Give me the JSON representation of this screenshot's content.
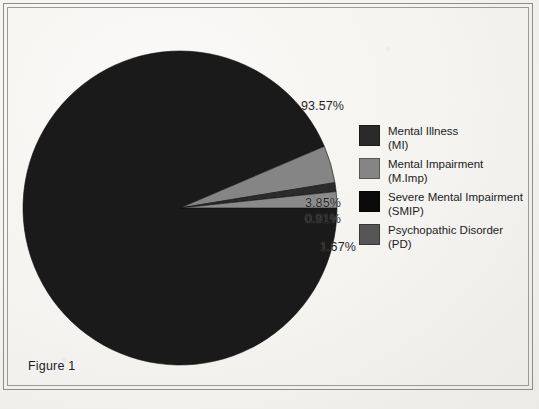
{
  "figure": {
    "caption": "Figure 1"
  },
  "colors": {
    "page_background": "#f4f3f0",
    "frame_line": "#8d8d8d",
    "text": "#1c1c1c",
    "slice_mi": "#1a1a1a",
    "slice_mimp": "#858585",
    "slice_smip": "#2b2b2b",
    "slice_pd": "#8a8a8a",
    "swatch_mi": "#2a2a2a",
    "swatch_mimp": "#858585",
    "swatch_smip": "#0a0a0a",
    "swatch_pd": "#555555"
  },
  "labels": {
    "mi": "93.57%",
    "mimp": "3.85%",
    "smip": "0.91%",
    "pd": "1.67%"
  },
  "legend": {
    "items": [
      {
        "name_line1": "Mental Illness",
        "name_line2": "(MI)",
        "color": "#2a2a2a"
      },
      {
        "name_line1": "Mental Impairment",
        "name_line2": "(M.Imp)",
        "color": "#858585"
      },
      {
        "name_line1": "Severe Mental Impairment",
        "name_line2": "(SMIP)",
        "color": "#0a0a0a"
      },
      {
        "name_line1": "Psychopathic Disorder",
        "name_line2": "(PD)",
        "color": "#555555"
      }
    ]
  },
  "chart_data": {
    "type": "pie",
    "title": "Figure 1",
    "subtitle": "",
    "xlabel": "",
    "ylabel": "",
    "grid": false,
    "legend_position": "right",
    "start_angle_deg": 0,
    "direction": "clockwise",
    "units": "percent",
    "labels": [
      "Mental Illness (MI)",
      "Mental Impairment (M.Imp)",
      "Severe Mental Impairment (SMIP)",
      "Psychopathic Disorder (PD)"
    ],
    "short_labels": [
      "MI",
      "M.Imp",
      "SMIP",
      "PD"
    ],
    "values": [
      93.57,
      3.85,
      0.91,
      1.67
    ],
    "data_labels": [
      "93.57%",
      "3.85%",
      "0.91%",
      "1.67%"
    ],
    "colors": [
      "#1a1a1a",
      "#858585",
      "#2b2b2b",
      "#8a8a8a"
    ],
    "total": 100.0
  }
}
